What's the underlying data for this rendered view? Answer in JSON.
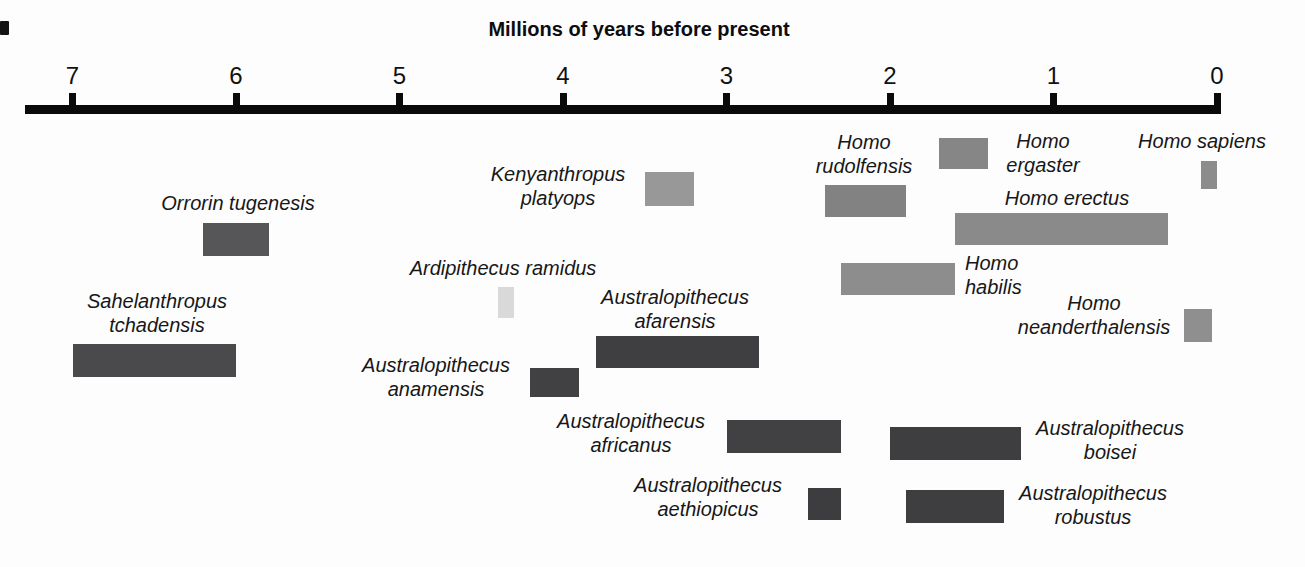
{
  "title": "Millions of years before present",
  "chart_data": {
    "type": "bar",
    "variant": "horizontal-timeline-gantt",
    "title": "Millions of years before present",
    "xlabel": "Millions of years before present",
    "legend": "none",
    "grid": false,
    "axis": {
      "unit": "millions of years before present",
      "min": 0,
      "max": 7,
      "direction": "values decrease left-to-right (7 at left, 0 at right)",
      "ticks": [
        7,
        6,
        5,
        4,
        3,
        2,
        1,
        0
      ],
      "origin_px": 1217,
      "px_per_unit": 163.5,
      "line_left_px": 25,
      "line_top_px": 105,
      "line_thickness_px": 9,
      "tick_width_px": 7,
      "tick_top_px": 93,
      "tick_label_top_px": 64
    },
    "species": [
      {
        "name": "Sahelanthropus tchadensis",
        "label_lines": [
          "Sahelanthropus",
          "tchadensis"
        ],
        "start_mya": 7.0,
        "end_mya": 6.0,
        "color": "#4a4a4c",
        "layout": {
          "bar_top_px": 344,
          "bar_height_px": 33,
          "label_x_px": 157,
          "label_top_px": 289,
          "label_align": "center"
        }
      },
      {
        "name": "Orrorin tugenesis",
        "label_lines": [
          "Orrorin tugenesis"
        ],
        "start_mya": 6.2,
        "end_mya": 5.8,
        "color": "#565658",
        "layout": {
          "bar_top_px": 223,
          "bar_height_px": 33,
          "label_x_px": 238,
          "label_top_px": 191,
          "label_align": "center"
        }
      },
      {
        "name": "Ardipithecus ramidus",
        "label_lines": [
          "Ardipithecus ramidus"
        ],
        "start_mya": 4.4,
        "end_mya": 4.3,
        "color": "#d9d9d9",
        "layout": {
          "bar_top_px": 287,
          "bar_height_px": 31,
          "label_x_px": 503,
          "label_top_px": 256,
          "label_align": "center"
        }
      },
      {
        "name": "Australopithecus anamensis",
        "label_lines": [
          "Australopithecus",
          "anamensis"
        ],
        "start_mya": 4.2,
        "end_mya": 3.9,
        "color": "#414143",
        "layout": {
          "bar_top_px": 368,
          "bar_height_px": 29,
          "label_x_px": 436,
          "label_top_px": 353,
          "label_align": "center"
        }
      },
      {
        "name": "Australopithecus afarensis",
        "label_lines": [
          "Australopithecus",
          "afarensis"
        ],
        "start_mya": 3.8,
        "end_mya": 2.8,
        "color": "#3f3f41",
        "layout": {
          "bar_top_px": 336,
          "bar_height_px": 32,
          "label_x_px": 675,
          "label_top_px": 285,
          "label_align": "center"
        }
      },
      {
        "name": "Kenyanthropus platyops",
        "label_lines": [
          "Kenyanthropus",
          "platyops"
        ],
        "start_mya": 3.5,
        "end_mya": 3.2,
        "color": "#989898",
        "layout": {
          "bar_top_px": 172,
          "bar_height_px": 34,
          "label_x_px": 558,
          "label_top_px": 162,
          "label_align": "center"
        }
      },
      {
        "name": "Australopithecus africanus",
        "label_lines": [
          "Australopithecus",
          "africanus"
        ],
        "start_mya": 3.0,
        "end_mya": 2.3,
        "color": "#414143",
        "layout": {
          "bar_top_px": 420,
          "bar_height_px": 33,
          "label_x_px": 631,
          "label_top_px": 409,
          "label_align": "center"
        }
      },
      {
        "name": "Australopithecus aethiopicus",
        "label_lines": [
          "Australopithecus",
          "aethiopicus"
        ],
        "start_mya": 2.5,
        "end_mya": 2.3,
        "color": "#3d3d3f",
        "layout": {
          "bar_top_px": 488,
          "bar_height_px": 32,
          "label_x_px": 708,
          "label_top_px": 473,
          "label_align": "center"
        }
      },
      {
        "name": "Homo rudolfensis",
        "label_lines": [
          "Homo",
          "rudolfensis"
        ],
        "start_mya": 2.4,
        "end_mya": 1.9,
        "color": "#828282",
        "layout": {
          "bar_top_px": 185,
          "bar_height_px": 32,
          "label_x_px": 864,
          "label_top_px": 130,
          "label_align": "center"
        }
      },
      {
        "name": "Homo habilis",
        "label_lines": [
          "Homo",
          "habilis"
        ],
        "start_mya": 2.3,
        "end_mya": 1.6,
        "color": "#8d8d8d",
        "layout": {
          "bar_top_px": 263,
          "bar_height_px": 32,
          "label_x_px": 965,
          "label_top_px": 251,
          "label_align": "left"
        }
      },
      {
        "name": "Australopithecus boisei",
        "label_lines": [
          "Australopithecus",
          "boisei"
        ],
        "start_mya": 2.0,
        "end_mya": 1.2,
        "color": "#3e3e40",
        "layout": {
          "bar_top_px": 427,
          "bar_height_px": 33,
          "label_x_px": 1110,
          "label_top_px": 416,
          "label_align": "center"
        }
      },
      {
        "name": "Australopithecus robustus",
        "label_lines": [
          "Australopithecus",
          "robustus"
        ],
        "start_mya": 1.9,
        "end_mya": 1.3,
        "color": "#3e3e40",
        "layout": {
          "bar_top_px": 490,
          "bar_height_px": 33,
          "label_x_px": 1093,
          "label_top_px": 481,
          "label_align": "center"
        }
      },
      {
        "name": "Homo ergaster",
        "label_lines": [
          "Homo",
          "ergaster"
        ],
        "start_mya": 1.7,
        "end_mya": 1.4,
        "color": "#868686",
        "layout": {
          "bar_top_px": 138,
          "bar_height_px": 31,
          "label_x_px": 1043,
          "label_top_px": 129,
          "label_align": "center"
        }
      },
      {
        "name": "Homo erectus",
        "label_lines": [
          "Homo erectus"
        ],
        "start_mya": 1.6,
        "end_mya": 0.3,
        "color": "#8a8a8a",
        "layout": {
          "bar_top_px": 213,
          "bar_height_px": 32,
          "label_x_px": 1067,
          "label_top_px": 186,
          "label_align": "center"
        }
      },
      {
        "name": "Homo neanderthalensis",
        "label_lines": [
          "Homo",
          "neanderthalensis"
        ],
        "start_mya": 0.2,
        "end_mya": 0.03,
        "color": "#8f8f8f",
        "layout": {
          "bar_top_px": 309,
          "bar_height_px": 33,
          "label_x_px": 1094,
          "label_top_px": 291,
          "label_align": "center"
        }
      },
      {
        "name": "Homo sapiens",
        "label_lines": [
          "Homo sapiens"
        ],
        "start_mya": 0.1,
        "end_mya": 0.0,
        "color": "#8c8c8c",
        "layout": {
          "bar_top_px": 161,
          "bar_height_px": 28,
          "label_x_px": 1202,
          "label_top_px": 129,
          "label_align": "center"
        }
      }
    ]
  }
}
